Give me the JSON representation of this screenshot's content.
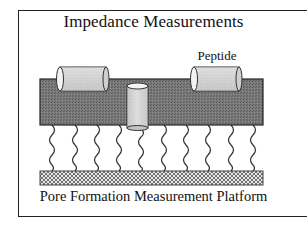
{
  "diagram": {
    "title": "Impedance Measurements",
    "labels": {
      "peptide": "Peptide",
      "caption": "Pore Formation Measurement Platform"
    },
    "colors": {
      "frame": "#222222",
      "membrane": "#6e6e6e",
      "peptide_fill": "#d4d4d4",
      "pore_fill": "#cfcfcf",
      "tether": "#333333",
      "support_fill": "#dcdcdc",
      "support_hatch": "#555555"
    },
    "components": [
      {
        "id": "membrane",
        "description": "Lipid bilayer membrane (dark shaded slab)"
      },
      {
        "id": "peptide-surface-1",
        "description": "Peptide lying horizontally on membrane surface (left)"
      },
      {
        "id": "peptide-surface-2",
        "description": "Peptide lying horizontally on membrane surface (right), labeled Peptide"
      },
      {
        "id": "peptide-pore",
        "description": "Peptide inserted vertically through membrane forming a pore"
      },
      {
        "id": "tethers",
        "description": "Ten wavy tether linkers connecting membrane to support",
        "count": 10
      },
      {
        "id": "support",
        "description": "Cross-hatched solid support / electrode surface"
      }
    ]
  }
}
